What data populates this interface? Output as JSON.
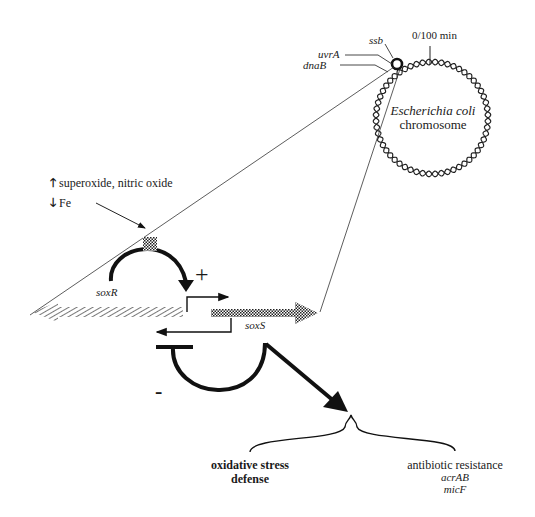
{
  "chromosome": {
    "title_italic": "Escherichia coli",
    "title": "chromosome",
    "origin_label": "0/100 min",
    "genes": [
      {
        "name": "ssb"
      },
      {
        "name": "uvrA"
      },
      {
        "name": "dnaB"
      }
    ]
  },
  "signals": {
    "up": {
      "icon": "up-arrow-icon",
      "label": "superoxide, nitric oxide"
    },
    "down": {
      "icon": "down-arrow-icon",
      "label": "Fe"
    }
  },
  "locus": {
    "soxR_label": "soxR",
    "soxS_label": "soxS",
    "activation_sign": "+",
    "repression_sign": "-"
  },
  "outcomes": {
    "left": {
      "line1": "oxidative stress",
      "line2": "defense"
    },
    "right": {
      "title": "antibiotic resistance",
      "genes": [
        "acrAB",
        "micF"
      ]
    }
  },
  "colors": {
    "ink": "#111111",
    "line": "#333333",
    "background": "#ffffff"
  }
}
